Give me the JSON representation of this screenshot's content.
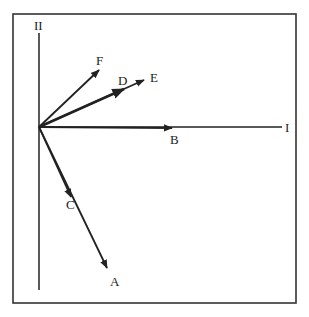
{
  "diagram": {
    "axes": {
      "horizontal_label": "I",
      "vertical_label": "II",
      "origin": [
        39,
        127
      ]
    },
    "vectors": [
      {
        "name": "A",
        "tip": [
          107,
          268
        ],
        "label_pos": [
          110,
          286
        ]
      },
      {
        "name": "B",
        "tip": [
          172,
          128
        ],
        "label_pos": [
          170,
          144
        ]
      },
      {
        "name": "C",
        "tip": [
          71,
          197
        ],
        "label_pos": [
          66,
          209
        ]
      },
      {
        "name": "D",
        "tip": [
          124,
          89
        ],
        "label_pos": [
          118,
          85
        ]
      },
      {
        "name": "E",
        "tip": [
          144,
          80
        ],
        "label_pos": [
          150,
          82
        ]
      },
      {
        "name": "F",
        "tip": [
          99,
          70
        ],
        "label_pos": [
          96,
          65
        ]
      }
    ],
    "colors": {
      "line": "#222222",
      "frame": "#333333",
      "background": "#ffffff"
    }
  }
}
